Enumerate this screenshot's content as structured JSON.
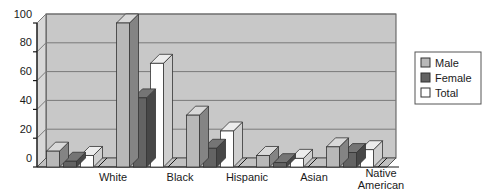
{
  "chart_data": {
    "type": "bar",
    "title": "",
    "subtitle": "",
    "xlabel": "",
    "ylabel": "",
    "categories": [
      "White",
      "Black",
      "Hispanic",
      "Asian",
      "Native American"
    ],
    "series": [
      {
        "name": "Male",
        "values": [
          11,
          100,
          36,
          8,
          14
        ],
        "color": "#b8b8b8"
      },
      {
        "name": "Female",
        "values": [
          4,
          48,
          13,
          3,
          10
        ],
        "color": "#636363"
      },
      {
        "name": "Total",
        "values": [
          8,
          72,
          25,
          6,
          12
        ],
        "color": "#ffffff"
      }
    ],
    "ylim": [
      0,
      100
    ],
    "yticks": [
      0,
      20,
      40,
      60,
      80,
      100
    ],
    "ytick_labels": [
      "0",
      "20",
      "40",
      "60",
      "80",
      "100"
    ],
    "grid": true,
    "grid_axis": "y",
    "legend": [
      "Male",
      "Female",
      "Total"
    ],
    "legend_position": "right",
    "style": "3d-grouped-bars",
    "plot_background": "#c8c8c8",
    "axis_color": "#1a1a1a",
    "grid_color": "#7a7a7a"
  },
  "category_labels": {
    "0": "White",
    "1": "Black",
    "2": "Hispanic",
    "3": "Asian",
    "4a": "Native",
    "4b": "American"
  },
  "y_axis": {
    "t0": "0",
    "t1": "20",
    "t2": "40",
    "t3": "60",
    "t4": "80",
    "t5": "100"
  },
  "legend": {
    "male": "Male",
    "female": "Female",
    "total": "Total"
  }
}
